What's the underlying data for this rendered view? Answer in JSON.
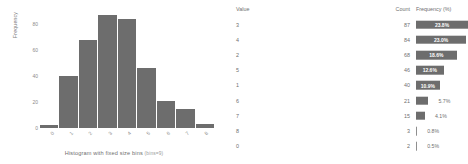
{
  "chart_data": {
    "type": "bar",
    "title": "",
    "xlabel": "Histogram with fixed size bins",
    "xlabel_sub": "(bins=9)",
    "ylabel": "Frequency",
    "categories": [
      "0",
      "1",
      "2",
      "3",
      "4",
      "5",
      "6",
      "7",
      "8"
    ],
    "values": [
      2,
      40,
      68,
      87,
      84,
      46,
      21,
      15,
      3
    ],
    "yticks": [
      "0",
      "20",
      "40",
      "60",
      "80"
    ],
    "ylim": [
      0,
      90
    ],
    "grid": false,
    "legend": "none",
    "bar_color": "#6d6d6d"
  },
  "table": {
    "headers": {
      "value": "Value",
      "count": "Count",
      "frequency": "Frequency (%)"
    },
    "rows": [
      {
        "value": "3",
        "count": "87",
        "frequency": "23.8%",
        "pct": 23.8,
        "label_inside": true
      },
      {
        "value": "4",
        "count": "84",
        "frequency": "23.0%",
        "pct": 23.0,
        "label_inside": true
      },
      {
        "value": "2",
        "count": "68",
        "frequency": "18.6%",
        "pct": 18.6,
        "label_inside": true
      },
      {
        "value": "5",
        "count": "46",
        "frequency": "12.6%",
        "pct": 12.6,
        "label_inside": true
      },
      {
        "value": "1",
        "count": "40",
        "frequency": "10.9%",
        "pct": 10.9,
        "label_inside": true
      },
      {
        "value": "6",
        "count": "21",
        "frequency": "5.7%",
        "pct": 5.7,
        "label_inside": false
      },
      {
        "value": "7",
        "count": "15",
        "frequency": "4.1%",
        "pct": 4.1,
        "label_inside": false
      },
      {
        "value": "8",
        "count": "3",
        "frequency": "0.8%",
        "pct": 0.8,
        "label_inside": false
      },
      {
        "value": "0",
        "count": "2",
        "frequency": "0.5%",
        "pct": 0.5,
        "label_inside": false
      }
    ]
  }
}
